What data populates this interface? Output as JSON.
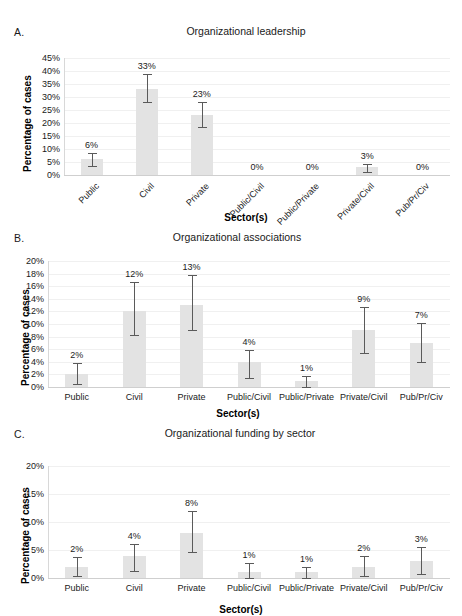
{
  "figure": {
    "y_axis_title": "Percentage of cases",
    "x_axis_title": "Sector(s)",
    "bar_color": "#e3e3e3",
    "error_color": "#5a5a5a",
    "grid_color": "#f0f0f0"
  },
  "panels": [
    {
      "letter": "A.",
      "title": "Organizational leadership"
    },
    {
      "letter": "B.",
      "title": "Organizational associations"
    },
    {
      "letter": "C.",
      "title": "Organizational funding by sector"
    }
  ],
  "chart_data": [
    {
      "type": "bar",
      "panel": "A",
      "title": "Organizational leadership",
      "xlabel": "Sector(s)",
      "ylabel": "Percentage of cases",
      "ylim": [
        0,
        45
      ],
      "ytick_step": 5,
      "ytick_labels": [
        "0%",
        "5%",
        "10%",
        "15%",
        "20%",
        "25%",
        "30%",
        "35%",
        "40%",
        "45%"
      ],
      "grid": true,
      "legend": "none",
      "xtick_rotation": -45,
      "categories": [
        "Public",
        "Civil",
        "Private",
        "Public/Civil",
        "Public/Private",
        "Private/Civil",
        "Pub/Pr/Civ"
      ],
      "values": [
        6,
        33,
        23,
        0,
        0,
        3,
        0
      ],
      "data_labels": [
        "6%",
        "33%",
        "23%",
        "0%",
        "0%",
        "3%",
        "0%"
      ],
      "error_low": [
        3.6,
        28.2,
        18.3,
        0,
        0,
        1.3,
        0
      ],
      "error_high": [
        8.6,
        39.0,
        28.0,
        0,
        0,
        4.1,
        0
      ]
    },
    {
      "type": "bar",
      "panel": "B",
      "title": "Organizational associations",
      "xlabel": "Sector(s)",
      "ylabel": "Percentage of cases",
      "ylim": [
        0,
        20
      ],
      "ytick_step": 2,
      "ytick_labels": [
        "0%",
        "2%",
        "4%",
        "6%",
        "8%",
        "10%",
        "12%",
        "14%",
        "16%",
        "18%",
        "20%"
      ],
      "grid": true,
      "legend": "none",
      "xtick_rotation": 0,
      "categories": [
        "Public",
        "Civil",
        "Private",
        "Public/Civil",
        "Public/Private",
        "Private/Civil",
        "Pub/Pr/Civ"
      ],
      "values": [
        2,
        12,
        13,
        4,
        1,
        9,
        7
      ],
      "data_labels": [
        "2%",
        "12%",
        "13%",
        "4%",
        "1%",
        "9%",
        "7%"
      ],
      "error_low": [
        0.4,
        8.2,
        9.0,
        1.5,
        0.0,
        5.4,
        3.9
      ],
      "error_high": [
        3.8,
        16.6,
        17.8,
        5.9,
        1.8,
        12.7,
        10.2
      ]
    },
    {
      "type": "bar",
      "panel": "C",
      "title": "Organizational funding by sector",
      "xlabel": "Sector(s)",
      "ylabel": "Percentage of cases",
      "ylim": [
        0,
        20
      ],
      "ytick_step": 5,
      "ytick_labels": [
        "0%",
        "5%",
        "10%",
        "15%",
        "20%"
      ],
      "grid": true,
      "legend": "none",
      "xtick_rotation": 0,
      "categories": [
        "Public",
        "Civil",
        "Private",
        "Public/Civil",
        "Public/Private",
        "Private/Civil",
        "Pub/Pr/Civ"
      ],
      "values": [
        2,
        4,
        8,
        1,
        1,
        2,
        3
      ],
      "data_labels": [
        "2%",
        "4%",
        "8%",
        "1%",
        "1%",
        "2%",
        "3%"
      ],
      "error_low": [
        0.3,
        1.2,
        4.6,
        0.0,
        0.0,
        0.4,
        0.8
      ],
      "error_high": [
        3.8,
        6.1,
        12.0,
        2.6,
        2.0,
        3.9,
        5.5
      ]
    }
  ]
}
